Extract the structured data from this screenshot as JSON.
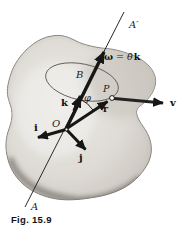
{
  "figure": {
    "caption": "Fig. 15.9",
    "labels": {
      "axis_top": "A′",
      "axis_bottom": "A",
      "omega": "ω",
      "equals": " = ",
      "theta_dot": "θ̇",
      "k_unit_in_eq": "k",
      "point_B": "B",
      "point_P": "P",
      "point_O": "O",
      "angle_phi": "φ",
      "vec_k": "k",
      "vec_r": "r",
      "vec_v": "v",
      "vec_i": "i",
      "vec_j": "j"
    },
    "colors": {
      "background": "#ffffff",
      "body_fill_light": "#e9e7e2",
      "body_fill_mid": "#dbd8d2",
      "body_fill_dark": "#b7b3ac",
      "body_edge": "#7e7a73",
      "ink": "#1c1c1c",
      "path_ellipse": "#5f5b55"
    }
  }
}
